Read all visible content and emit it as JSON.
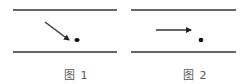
{
  "figures": [
    {
      "caption": "图 1",
      "description": "Arrow pointing diagonally down-right toward a dot between two parallel lines",
      "arrow": {
        "x1": 45,
        "y1": 22,
        "x2": 69,
        "y2": 40
      },
      "dot": {
        "cx": 77,
        "cy": 40
      }
    },
    {
      "caption": "图 2",
      "description": "Horizontal arrow pointing right, dot below and right of arrow tip, between two parallel lines",
      "arrow": {
        "x1": 156,
        "y1": 30,
        "x2": 191,
        "y2": 30
      },
      "dot": {
        "cx": 201,
        "cy": 40
      }
    }
  ],
  "colors": {
    "line": "#333333",
    "caption": "#555555"
  }
}
